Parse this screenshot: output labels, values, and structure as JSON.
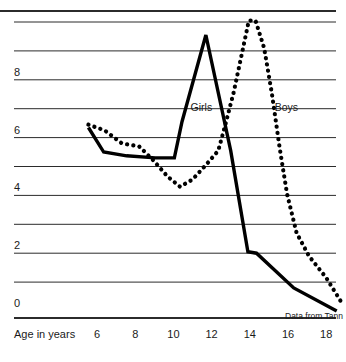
{
  "chart_data": {
    "type": "line",
    "title": "",
    "subtitle": "",
    "xlabel": "Age in years",
    "ylabel": "",
    "xlim": [
      4.8,
      18.9
    ],
    "ylim": [
      0,
      10.4
    ],
    "grid": true,
    "grid_axis": "y",
    "legend_position": "inline-annotation",
    "source_note": "Data from Tann",
    "xticks": [
      6,
      8,
      10,
      12,
      14,
      16,
      18
    ],
    "xtick_labels": [
      "6",
      "8",
      "10",
      "12",
      "14",
      "16",
      "18"
    ],
    "yticks": [
      0,
      2,
      4,
      6,
      8
    ],
    "ytick_labels": [
      "0",
      "2",
      "4",
      "6",
      "8"
    ],
    "gridline_values": [
      10.4,
      10,
      9,
      8,
      7,
      6,
      5,
      4,
      3,
      2,
      1,
      0
    ],
    "series": [
      {
        "name": "Girls",
        "style": "solid",
        "color": "#000000",
        "label_x": 10.9,
        "label_y": 7.05,
        "points": [
          [
            5.55,
            6.35
          ],
          [
            6.35,
            5.5
          ],
          [
            7.55,
            5.37
          ],
          [
            9.05,
            5.3
          ],
          [
            10.05,
            5.3
          ],
          [
            10.45,
            6.55
          ],
          [
            11.7,
            9.55
          ],
          [
            13.0,
            5.55
          ],
          [
            13.9,
            2.05
          ],
          [
            14.35,
            2.0
          ],
          [
            16.3,
            0.8
          ],
          [
            18.55,
            0.0
          ]
        ]
      },
      {
        "name": "Boys",
        "style": "dotted",
        "color": "#000000",
        "label_x": 15.3,
        "label_y": 7.05,
        "points": [
          [
            5.55,
            6.45
          ],
          [
            6.4,
            6.25
          ],
          [
            7.3,
            5.8
          ],
          [
            8.2,
            5.7
          ],
          [
            8.9,
            5.25
          ],
          [
            9.7,
            4.65
          ],
          [
            10.35,
            4.3
          ],
          [
            11.0,
            4.55
          ],
          [
            11.7,
            5.05
          ],
          [
            12.35,
            5.55
          ],
          [
            12.7,
            6.4
          ],
          [
            13.15,
            7.55
          ],
          [
            13.6,
            8.95
          ],
          [
            13.95,
            10.05
          ],
          [
            14.3,
            10.05
          ],
          [
            14.75,
            9.1
          ],
          [
            15.15,
            7.55
          ],
          [
            15.55,
            5.7
          ],
          [
            15.95,
            4.05
          ],
          [
            16.45,
            2.7
          ],
          [
            17.1,
            1.9
          ],
          [
            18.0,
            1.15
          ],
          [
            18.75,
            0.35
          ]
        ]
      }
    ]
  }
}
